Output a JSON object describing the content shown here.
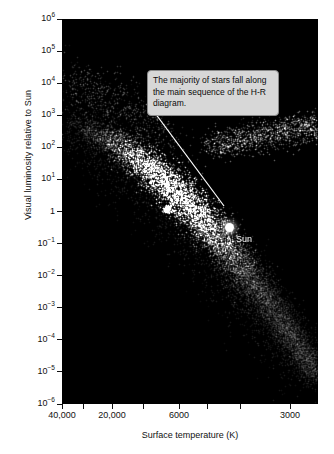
{
  "chart_data": {
    "type": "scatter",
    "title": "",
    "xlabel": "Surface temperature (K)",
    "ylabel": "Visual luminosity relative to Sun",
    "grid": false,
    "legend": null,
    "x_axis": {
      "scale": "log-reversed",
      "direction": "decreasing",
      "range": [
        40000,
        2400
      ],
      "labeled_ticks": [
        "40,000",
        "20,000",
        "6000",
        "3000"
      ],
      "tick_positions_px": [
        62,
        112,
        179,
        290
      ],
      "unlabeled_tick_positions_px": [
        83,
        143,
        207,
        240
      ]
    },
    "y_axis": {
      "scale": "log",
      "range": [
        1e-06,
        1000000.0
      ],
      "ticks": [
        {
          "label": "10",
          "exp": "6",
          "value": 1000000
        },
        {
          "label": "10",
          "exp": "5",
          "value": 100000
        },
        {
          "label": "10",
          "exp": "4",
          "value": 10000
        },
        {
          "label": "10",
          "exp": "3",
          "value": 1000
        },
        {
          "label": "10",
          "exp": "2",
          "value": 100
        },
        {
          "label": "10",
          "exp": "1",
          "value": 10
        },
        {
          "label": "1",
          "exp": "",
          "value": 1
        },
        {
          "label": "10",
          "exp": "−1",
          "value": 0.1
        },
        {
          "label": "10",
          "exp": "−2",
          "value": 0.01
        },
        {
          "label": "10",
          "exp": "−3",
          "value": 0.001
        },
        {
          "label": "10",
          "exp": "−4",
          "value": 0.0001
        },
        {
          "label": "10",
          "exp": "−5",
          "value": 1e-05
        },
        {
          "label": "10",
          "exp": "−6",
          "value": 1e-06
        }
      ]
    },
    "populations": [
      {
        "name": "main-sequence",
        "description": "dense diagonal band from hot/luminous upper-left to cool/faint lower-right",
        "point_count": 9000
      },
      {
        "name": "giant-branch",
        "description": "diffuse clump of cool luminous giants upper-right",
        "point_count": 1400
      },
      {
        "name": "upper-main-sequence-scatter",
        "description": "sparse hot luminous stars upper-left",
        "point_count": 700
      }
    ],
    "annotations": [
      {
        "name": "sun",
        "label": "Sun",
        "x_temp_K": 5800,
        "y_luminosity": 1
      },
      {
        "name": "main-sequence-callout",
        "text": "The majority of stars fall along the main sequence of the H-R diagram."
      }
    ]
  },
  "axes": {
    "y_title": "Visual luminosity relative to Sun",
    "x_title": "Surface temperature (K)"
  },
  "callout": {
    "text": "The majority of stars fall along the main sequence of the H-R diagram."
  },
  "sun": {
    "label": "Sun"
  },
  "colors": {
    "plot_background": "#000000",
    "page_background": "#ffffff",
    "axis_text": "#111111",
    "callout_fill": "#d7d7d7",
    "callout_border": "#8a8a8a",
    "leader_line": "#ffffff",
    "star_color": "#ffffff"
  }
}
